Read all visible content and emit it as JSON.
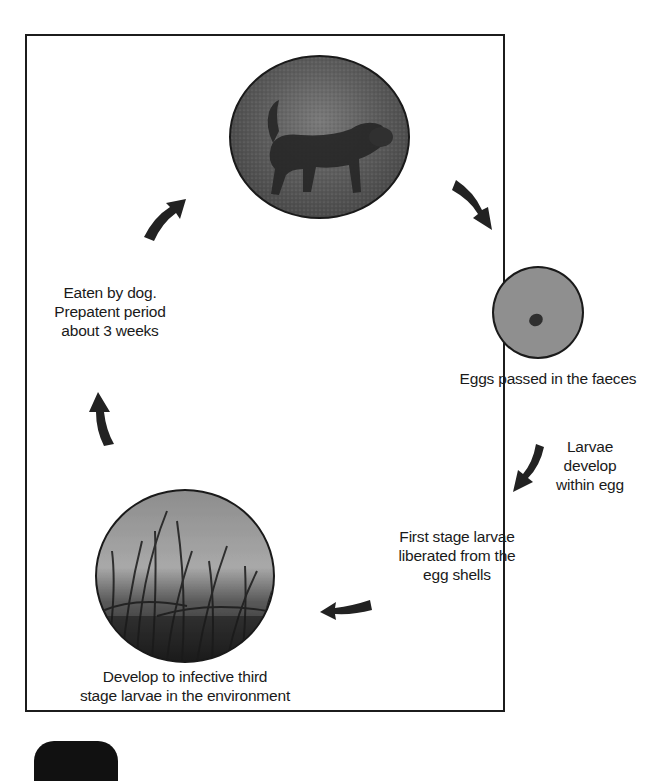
{
  "diagram": {
    "type": "life-cycle",
    "stages": [
      {
        "id": "dog",
        "image": "dog-photo",
        "caption": ""
      },
      {
        "id": "eggs",
        "image": "egg-micrograph",
        "caption": "Eggs passed in the faeces"
      },
      {
        "id": "larvae-develop",
        "caption_lines": [
          "Larvae",
          "develop",
          "within egg"
        ]
      },
      {
        "id": "first-stage",
        "caption_lines": [
          "First stage larvae",
          "liberated from the",
          "egg shells"
        ]
      },
      {
        "id": "third-stage",
        "image": "grass-photo",
        "caption_lines": [
          "Develop to infective third",
          "stage larvae in the environment"
        ]
      },
      {
        "id": "eaten",
        "caption_lines": [
          "Eaten by dog.",
          "Prepatent period",
          "about 3 weeks"
        ]
      }
    ],
    "arrows": [
      "dog-to-eggs",
      "eggs-to-larvae",
      "larvae-to-first-stage",
      "first-stage-to-third-stage",
      "third-stage-to-eaten",
      "eaten-to-dog"
    ]
  },
  "labels": {
    "eggs": "Eggs passed in the faeces",
    "larvae_1": "Larvae",
    "larvae_2": "develop",
    "larvae_3": "within egg",
    "first_1": "First stage larvae",
    "first_2": "liberated from the",
    "first_3": "egg shells",
    "third_1": "Develop to infective third",
    "third_2": "stage larvae in the environment",
    "eaten_1": "Eaten by dog.",
    "eaten_2": "Prepatent period",
    "eaten_3": "about 3 weeks"
  },
  "colors": {
    "border": "#1c1c1c",
    "arrow": "#222222",
    "egg_bg": "#8f8f8f",
    "photo_dark": "#3a3a3a"
  }
}
